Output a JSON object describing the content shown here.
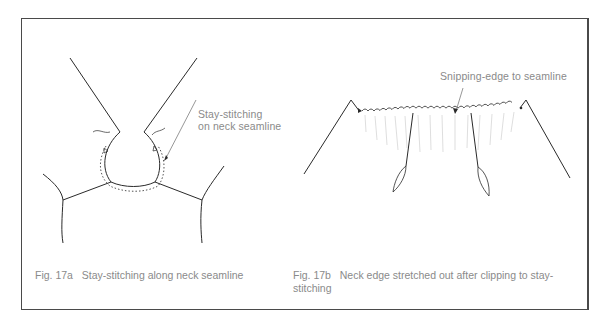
{
  "figure_a": {
    "annotation": {
      "line1": "Stay-stitching",
      "line2": "on neck seamline"
    },
    "caption_number": "Fig. 17a",
    "caption_text": "Stay-stitching along neck seamline"
  },
  "figure_b": {
    "annotation": "Snipping-edge to seamline",
    "caption_number": "Fig. 17b",
    "caption_text_line1": "Neck edge stretched out after clipping to stay-",
    "caption_text_line2": "stitching"
  },
  "colors": {
    "line": "#2a2a2a",
    "text": "#8a8a8a",
    "frame": "#4a4a4a"
  }
}
